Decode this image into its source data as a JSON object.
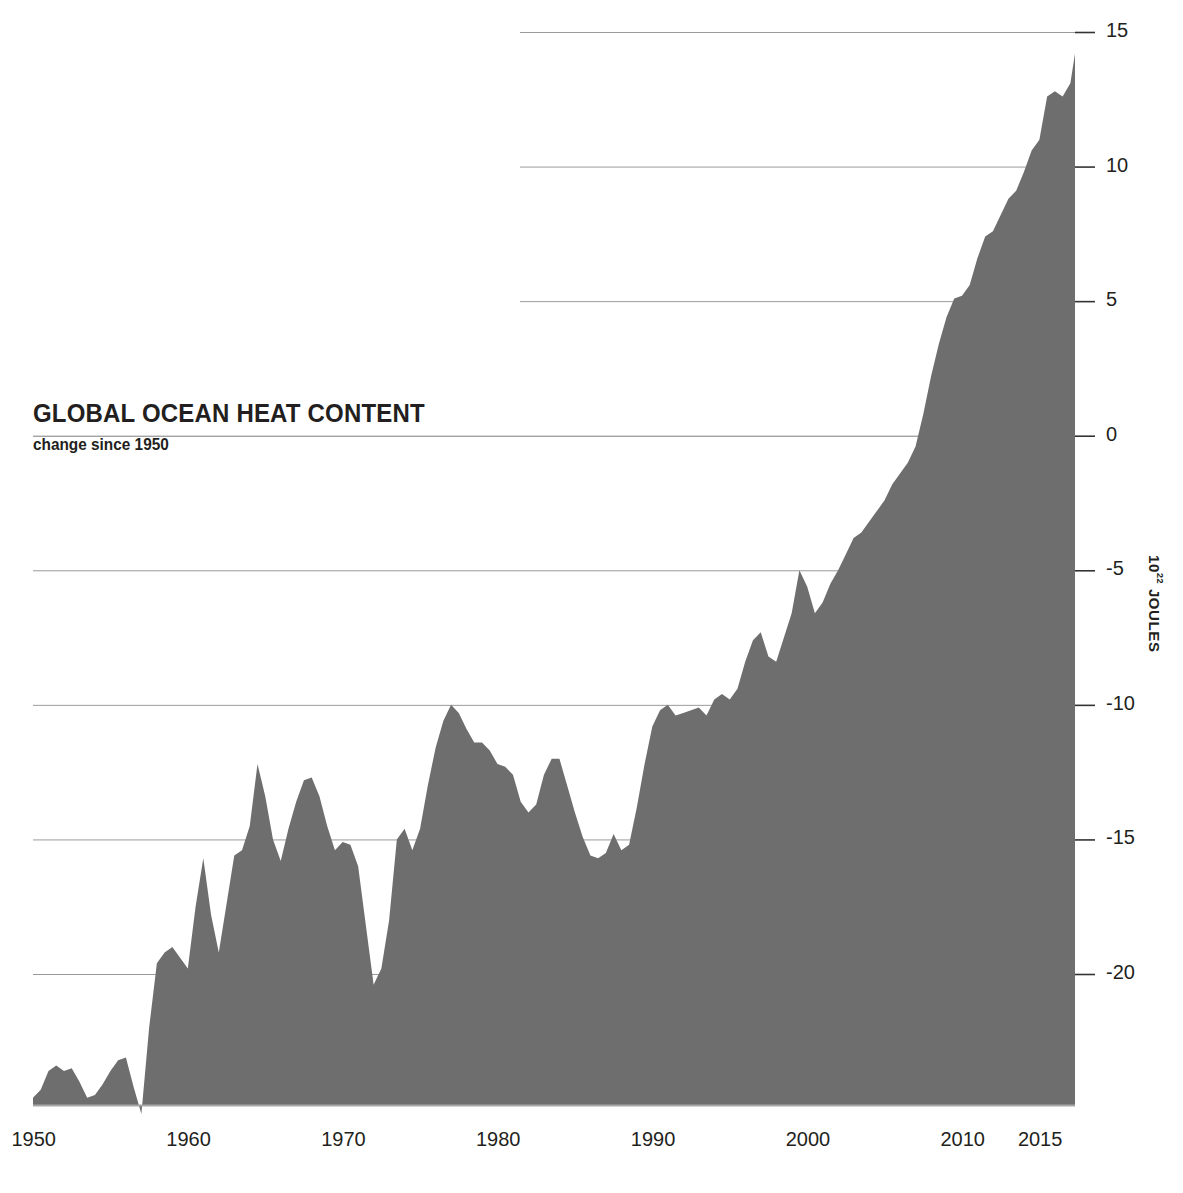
{
  "chart_data": {
    "type": "area",
    "title": "GLOBAL OCEAN HEAT CONTENT",
    "subtitle": "change since 1950",
    "xlabel": "",
    "ylabel": "10²² JOULES",
    "ylabel_base": "10",
    "ylabel_exp": "22",
    "ylabel_unit": " JOULES",
    "xlim": [
      1950,
      2017.3
    ],
    "ylim": [
      -26,
      15
    ],
    "grid": true,
    "gridlines": [
      15,
      10,
      5,
      0,
      -5,
      -10,
      -15,
      -20
    ],
    "legend": "none",
    "fill_color": "#6e6e6e",
    "grid_color": "#9a9a9a",
    "axis_color": "#8c8c8c",
    "text_color": "#231f20",
    "background": "#ffffff",
    "xticks": [
      1950,
      1960,
      1970,
      1980,
      1990,
      2000,
      2010,
      2015
    ],
    "xtick_labels": [
      "1950",
      "1960",
      "1970",
      "1980",
      "1990",
      "2000",
      "2010",
      "2015"
    ],
    "yticks": [
      15,
      10,
      5,
      0,
      -5,
      -10,
      -15,
      -20
    ],
    "ytick_labels": [
      "15",
      "10",
      "5",
      "0",
      "-5",
      "-10",
      "-15",
      "-20"
    ],
    "x": [
      1950.0,
      1950.5,
      1951.0,
      1951.5,
      1952.0,
      1952.5,
      1953.0,
      1953.5,
      1954.0,
      1954.5,
      1955.0,
      1955.5,
      1956.0,
      1956.5,
      1957.0,
      1957.5,
      1958.0,
      1958.5,
      1959.0,
      1959.5,
      1960.0,
      1960.5,
      1961.0,
      1961.5,
      1962.0,
      1962.5,
      1963.0,
      1963.5,
      1964.0,
      1964.5,
      1965.0,
      1965.5,
      1966.0,
      1966.5,
      1967.0,
      1967.5,
      1968.0,
      1968.5,
      1969.0,
      1969.5,
      1970.0,
      1970.5,
      1971.0,
      1971.5,
      1972.0,
      1972.5,
      1973.0,
      1973.5,
      1974.0,
      1974.5,
      1975.0,
      1975.5,
      1976.0,
      1976.5,
      1977.0,
      1977.5,
      1978.0,
      1978.5,
      1979.0,
      1979.5,
      1980.0,
      1980.5,
      1981.0,
      1981.5,
      1982.0,
      1982.5,
      1983.0,
      1983.5,
      1984.0,
      1984.5,
      1985.0,
      1985.5,
      1986.0,
      1986.5,
      1987.0,
      1987.5,
      1988.0,
      1988.5,
      1989.0,
      1989.5,
      1990.0,
      1990.5,
      1991.0,
      1991.5,
      1992.0,
      1992.5,
      1993.0,
      1993.5,
      1994.0,
      1994.5,
      1995.0,
      1995.5,
      1996.0,
      1996.5,
      1997.0,
      1997.5,
      1998.0,
      1998.5,
      1999.0,
      1999.5,
      2000.0,
      2000.5,
      2001.0,
      2001.5,
      2002.0,
      2002.5,
      2003.0,
      2003.5,
      2004.0,
      2004.5,
      2005.0,
      2005.5,
      2006.0,
      2006.5,
      2007.0,
      2007.5,
      2008.0,
      2008.5,
      2009.0,
      2009.5,
      2010.0,
      2010.5,
      2011.0,
      2011.5,
      2012.0,
      2012.5,
      2013.0,
      2013.5,
      2014.0,
      2014.5,
      2015.0,
      2015.5,
      2016.0,
      2016.5,
      2017.0,
      2017.3
    ],
    "y": [
      -24.6,
      -24.3,
      -23.6,
      -23.4,
      -23.6,
      -23.5,
      -24.0,
      -24.6,
      -24.5,
      -24.1,
      -23.6,
      -23.2,
      -23.1,
      -24.2,
      -25.2,
      -22.0,
      -19.6,
      -19.2,
      -19.0,
      -19.4,
      -19.8,
      -17.5,
      -15.7,
      -17.8,
      -19.2,
      -17.4,
      -15.6,
      -15.4,
      -14.5,
      -12.2,
      -13.4,
      -15.0,
      -15.8,
      -14.6,
      -13.6,
      -12.8,
      -12.7,
      -13.4,
      -14.5,
      -15.4,
      -15.1,
      -15.2,
      -16.0,
      -18.2,
      -20.4,
      -19.8,
      -18.0,
      -15.0,
      -14.6,
      -15.4,
      -14.6,
      -13.0,
      -11.6,
      -10.6,
      -10.0,
      -10.3,
      -10.9,
      -11.4,
      -11.4,
      -11.7,
      -12.2,
      -12.3,
      -12.6,
      -13.6,
      -14.0,
      -13.7,
      -12.6,
      -12.0,
      -12.0,
      -13.0,
      -14.0,
      -14.9,
      -15.6,
      -15.7,
      -15.5,
      -14.8,
      -15.4,
      -15.2,
      -13.8,
      -12.2,
      -10.8,
      -10.2,
      -10.0,
      -10.4,
      -10.3,
      -10.2,
      -10.1,
      -10.4,
      -9.8,
      -9.6,
      -9.8,
      -9.4,
      -8.4,
      -7.6,
      -7.3,
      -8.2,
      -8.4,
      -7.5,
      -6.6,
      -5.0,
      -5.6,
      -6.6,
      -6.2,
      -5.5,
      -5.0,
      -4.4,
      -3.8,
      -3.6,
      -3.2,
      -2.8,
      -2.4,
      -1.8,
      -1.4,
      -1.0,
      -0.4,
      0.8,
      2.2,
      3.4,
      4.4,
      5.1,
      5.2,
      5.6,
      6.6,
      7.4,
      7.6,
      8.2,
      8.8,
      9.1,
      9.8,
      10.6,
      11.0,
      12.6,
      12.8,
      12.6,
      13.1,
      14.2
    ],
    "annotations": []
  },
  "axis": {
    "ytick_positions_px": [
      32,
      167,
      301,
      436,
      570,
      705,
      839,
      974
    ],
    "plot_left_px": 33,
    "plot_right_px": 1075,
    "baseline_px": 1105
  }
}
